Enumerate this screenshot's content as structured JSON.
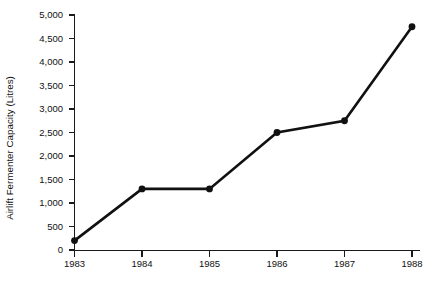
{
  "chart_data": {
    "type": "line",
    "title": "",
    "subtitle": "",
    "xlabel": "",
    "ylabel": "Airlift Fermenter Capacity (Litres)",
    "categories": [
      "1983",
      "1984",
      "1985",
      "1986",
      "1987",
      "1988"
    ],
    "x": [
      1983,
      1984,
      1985,
      1986,
      1987,
      1988
    ],
    "values": [
      200,
      1300,
      1300,
      2500,
      2750,
      4750
    ],
    "series": [
      {
        "name": "Airlift Fermenter Capacity",
        "values": [
          200,
          1300,
          1300,
          2500,
          2750,
          4750
        ]
      }
    ],
    "ylim": [
      0,
      5000
    ],
    "ytick_values": [
      0,
      500,
      1000,
      1500,
      2000,
      2500,
      3000,
      3500,
      4000,
      4500,
      5000
    ],
    "ytick_labels": [
      "0",
      "500",
      "1,000",
      "1,500",
      "2,000",
      "2,500",
      "3,000",
      "3,500",
      "4,000",
      "4,500",
      "5,000"
    ],
    "xtick_labels": [
      "1983",
      "1984",
      "1985",
      "1986",
      "1987",
      "1988"
    ],
    "grid": false,
    "legend": false,
    "legend_position": "none",
    "marker": "filled-circle",
    "line_color": "#111111",
    "marker_color": "#111111",
    "axis_color": "#1a1a1a",
    "background_color": "#ffffff",
    "annotations": []
  }
}
